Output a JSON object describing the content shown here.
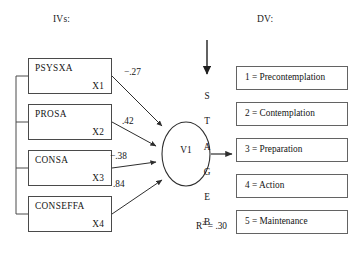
{
  "headers": {
    "iv": "IVs:",
    "dv": "DV:"
  },
  "iv_boxes": [
    {
      "name": "PSYSXA",
      "code": "X1",
      "x": 28,
      "y": 58,
      "w": 84,
      "h": 36
    },
    {
      "name": "PROSA",
      "code": "X2",
      "x": 28,
      "y": 104,
      "w": 84,
      "h": 36
    },
    {
      "name": "CONSA",
      "code": "X3",
      "x": 28,
      "y": 150,
      "w": 84,
      "h": 36
    },
    {
      "name": "CONSEFFA",
      "code": "X4",
      "x": 28,
      "y": 196,
      "w": 84,
      "h": 36
    }
  ],
  "paths": [
    {
      "from": "X1",
      "to": "V1",
      "coefficient": "−.27",
      "label_x": 124,
      "label_y": 67
    },
    {
      "from": "X2",
      "to": "V1",
      "coefficient": ".42",
      "label_x": 122,
      "label_y": 116
    },
    {
      "from": "X3",
      "to": "V1",
      "coefficient": "−.38",
      "label_x": 110,
      "label_y": 151
    },
    {
      "from": "X4",
      "to": "V1",
      "coefficient": ".84",
      "label_x": 113,
      "label_y": 179
    }
  ],
  "latent": {
    "label": "V1",
    "r_squared": "R",
    "r_squared_exponent": "2",
    "r_squared_value": "= .30"
  },
  "stage_letters": [
    {
      "letter": "S",
      "y": 91
    },
    {
      "letter": "T",
      "y": 116
    },
    {
      "letter": "A",
      "y": 142
    },
    {
      "letter": "G",
      "y": 167
    },
    {
      "letter": "E",
      "y": 192
    },
    {
      "letter": "B",
      "y": 217
    }
  ],
  "dv_boxes": [
    {
      "text": "1 = Precontemplation",
      "y": 66
    },
    {
      "text": "2 = Contemplation",
      "y": 102
    },
    {
      "text": "3 = Preparation",
      "y": 138
    },
    {
      "text": "4 = Action",
      "y": 174
    },
    {
      "text": "5 = Maintenance",
      "y": 210
    }
  ],
  "colors": {
    "stroke": "#3f3f3f",
    "box_border": "#4a4a4a",
    "dv_border": "#636363",
    "text": "#141414",
    "background": "#ffffff"
  }
}
